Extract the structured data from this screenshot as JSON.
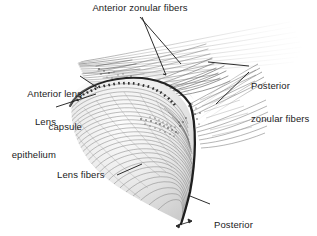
{
  "figure": {
    "kind": "anatomical-illustration",
    "background_color": "#ffffff",
    "ink_color": "#1b1b1b",
    "fiber_gray": "#8d8d8d",
    "fiber_light_gray": "#c6c6c6",
    "capsule_dark": "#2a2a2a"
  },
  "labels": {
    "anterior_zonular_fibers": "Anterior zonular fibers",
    "anterior_lens_capsule_line1": "Anterior lens",
    "anterior_lens_capsule_line2": "capsule",
    "lens_epithelium_line1": "Lens",
    "lens_epithelium_line2": "epithelium",
    "posterior_zonular_fibers_line1": "Posterior",
    "posterior_zonular_fibers_line2": "zonular fibers",
    "lens_fibers": "Lens fibers",
    "posterior_lens_capsule_line1": "Posterior",
    "posterior_lens_capsule_line2": "lens capsule"
  }
}
